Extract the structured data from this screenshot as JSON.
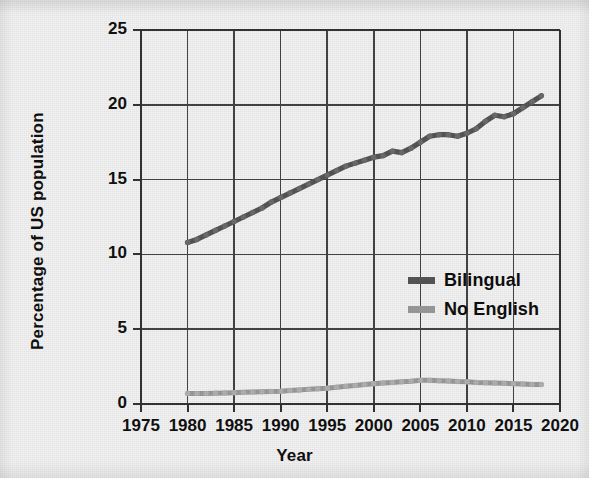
{
  "chart_data": {
    "type": "line",
    "title": "",
    "xlabel": "Year",
    "ylabel": "Percentage of US population",
    "xlim": [
      1975,
      2020
    ],
    "ylim": [
      0,
      25
    ],
    "xticks": [
      1975,
      1980,
      1985,
      1990,
      1995,
      2000,
      2005,
      2010,
      2015,
      2020
    ],
    "yticks": [
      0,
      5,
      10,
      15,
      20,
      25
    ],
    "grid": true,
    "legend_position": "center-right",
    "series": [
      {
        "name": "Bilingual",
        "color": "#555555",
        "x": [
          1980,
          1981,
          1982,
          1983,
          1984,
          1985,
          1986,
          1987,
          1988,
          1989,
          1990,
          1991,
          1992,
          1993,
          1994,
          1995,
          1996,
          1997,
          1998,
          1999,
          2000,
          2001,
          2002,
          2003,
          2004,
          2005,
          2006,
          2007,
          2008,
          2009,
          2010,
          2011,
          2012,
          2013,
          2014,
          2015,
          2016,
          2017,
          2018
        ],
        "values": [
          10.8,
          11.0,
          11.3,
          11.6,
          11.9,
          12.2,
          12.5,
          12.8,
          13.1,
          13.5,
          13.8,
          14.1,
          14.4,
          14.7,
          15.0,
          15.3,
          15.6,
          15.9,
          16.1,
          16.3,
          16.5,
          16.6,
          16.9,
          16.8,
          17.1,
          17.5,
          17.9,
          18.0,
          18.0,
          17.9,
          18.1,
          18.4,
          18.9,
          19.3,
          19.2,
          19.4,
          19.8,
          20.2,
          20.6
        ]
      },
      {
        "name": "No English",
        "color": "#9a9a9a",
        "x": [
          1980,
          1981,
          1982,
          1983,
          1984,
          1985,
          1986,
          1987,
          1988,
          1989,
          1990,
          1991,
          1992,
          1993,
          1994,
          1995,
          1996,
          1997,
          1998,
          1999,
          2000,
          2001,
          2002,
          2003,
          2004,
          2005,
          2006,
          2007,
          2008,
          2009,
          2010,
          2011,
          2012,
          2013,
          2014,
          2015,
          2016,
          2017,
          2018
        ],
        "values": [
          0.7,
          0.7,
          0.7,
          0.72,
          0.74,
          0.76,
          0.78,
          0.8,
          0.82,
          0.84,
          0.86,
          0.9,
          0.94,
          0.98,
          1.02,
          1.06,
          1.12,
          1.18,
          1.24,
          1.3,
          1.36,
          1.4,
          1.44,
          1.48,
          1.52,
          1.58,
          1.58,
          1.56,
          1.54,
          1.5,
          1.48,
          1.44,
          1.42,
          1.4,
          1.38,
          1.36,
          1.33,
          1.3,
          1.3
        ]
      }
    ]
  },
  "axes": {
    "y_title": "Percentage of US population",
    "x_title": "Year",
    "y_tick_labels": [
      "25",
      "20",
      "15",
      "10",
      "5",
      "0"
    ],
    "x_tick_labels": [
      "1975",
      "1980",
      "1985",
      "1990",
      "1995",
      "2000",
      "2005",
      "2010",
      "2015",
      "2020"
    ]
  },
  "legend": {
    "items": [
      {
        "label": "Bilingual",
        "color": "#555555"
      },
      {
        "label": "No English",
        "color": "#9a9a9a"
      }
    ]
  },
  "colors": {
    "background": "#f2f2f2",
    "axis": "#333333",
    "grid": "#444444",
    "bilingual": "#555555",
    "no_english": "#9a9a9a",
    "text": "#101010"
  }
}
